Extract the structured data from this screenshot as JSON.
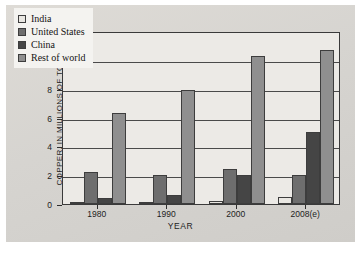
{
  "chart_data": {
    "type": "bar",
    "title": "",
    "xlabel": "YEAR",
    "ylabel": "COPPER, IN MILLIONS OF TONS",
    "categories": [
      "1980",
      "1990",
      "2000",
      "2008(e)"
    ],
    "ylim": [
      0,
      12
    ],
    "yticks": [
      0,
      2,
      4,
      6,
      8,
      10,
      12
    ],
    "ytick_labels": [
      "0",
      "2",
      "4",
      "6",
      "8",
      "10",
      "12"
    ],
    "grid": true,
    "legend_position": "upper-left",
    "series": [
      {
        "name": "India",
        "color": "#e9e7e2",
        "values": [
          0.1,
          0.1,
          0.2,
          0.5
        ]
      },
      {
        "name": "United States",
        "color": "#6e6e6e",
        "values": [
          2.2,
          2.0,
          2.45,
          2.0
        ]
      },
      {
        "name": "China",
        "color": "#454545",
        "values": [
          0.4,
          0.6,
          2.0,
          5.0
        ]
      },
      {
        "name": "Rest of world",
        "color": "#8f8f8f",
        "values": [
          6.3,
          7.9,
          10.3,
          10.7
        ]
      }
    ]
  },
  "colors": {
    "page_background": "#d9d9d6",
    "plot_background": "#eceae6",
    "axis": "#3a3a3a",
    "gridline": "#4a4a4a",
    "text": "#1d1d1d"
  }
}
